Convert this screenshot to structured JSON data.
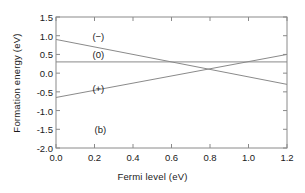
{
  "chart_data": {
    "type": "line",
    "title": "",
    "panel_label": "(b)",
    "xlabel": "Fermi level (eV)",
    "ylabel": "Formation energy (eV)",
    "xlim": [
      0.0,
      1.2
    ],
    "ylim": [
      -2.0,
      1.5
    ],
    "xticks": [
      0.0,
      0.2,
      0.4,
      0.6,
      0.8,
      1.0,
      1.2
    ],
    "xtick_labels": [
      "0.0",
      "0.2",
      "0.4",
      "0.6",
      "0.8",
      "1.0",
      "1.2"
    ],
    "yticks": [
      1.5,
      1.0,
      0.5,
      0.0,
      -0.5,
      -1.0,
      -1.5,
      -2.0
    ],
    "ytick_labels": [
      "1.5",
      "1.0",
      "0.5",
      "0.0",
      "-0.5",
      "-1.0",
      "-1.5",
      "-2.0"
    ],
    "grid": false,
    "legend": "inline-annotations",
    "line_color": "#8a8a8a",
    "axis_color": "#8a8a8a",
    "text_color": "#1a1a1a",
    "background": "#ffffff",
    "series": [
      {
        "name": "(-)",
        "charge": -1,
        "x": [
          0.0,
          1.2
        ],
        "values": [
          0.9,
          -0.3
        ],
        "label": "(−)",
        "label_x": 0.22,
        "label_y": 1.0
      },
      {
        "name": "(0)",
        "charge": 0,
        "x": [
          0.0,
          1.2
        ],
        "values": [
          0.3,
          0.3
        ],
        "label": "(0)",
        "label_x": 0.22,
        "label_y": 0.52
      },
      {
        "name": "(+)",
        "charge": 1,
        "x": [
          0.0,
          1.2
        ],
        "values": [
          -0.65,
          0.5
        ],
        "label": "(+)",
        "label_x": 0.22,
        "label_y": -0.4
      }
    ],
    "annotations": [
      {
        "text": "(b)",
        "x": 0.2,
        "y": -1.35
      }
    ],
    "transition_levels": [
      {
        "from": "(+)",
        "to": "(0)",
        "fermi_level": 0.99
      },
      {
        "from": "(0)",
        "to": "(-)",
        "fermi_level": 0.6
      },
      {
        "from": "(+)",
        "to": "(-)",
        "fermi_level": 0.78
      }
    ]
  }
}
